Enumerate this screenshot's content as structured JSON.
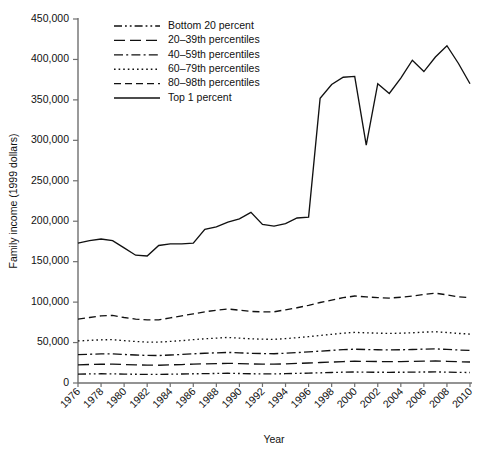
{
  "chart_data": {
    "type": "line",
    "title": "",
    "xlabel": "Year",
    "ylabel": "Family income (1999 dollars)",
    "xlim": [
      1976,
      2010
    ],
    "ylim": [
      0,
      450000
    ],
    "ytick_labels": [
      "0",
      "50,000",
      "100,000",
      "150,000",
      "200,000",
      "250,000",
      "300,000",
      "350,000",
      "400,000",
      "450,000"
    ],
    "ytick_values": [
      0,
      50000,
      100000,
      150000,
      200000,
      250000,
      300000,
      350000,
      400000,
      450000
    ],
    "xtick_labels": [
      "1976",
      "1978",
      "1980",
      "1982",
      "1984",
      "1986",
      "1988",
      "1990",
      "1992",
      "1994",
      "1996",
      "1998",
      "2000",
      "2002",
      "2004",
      "2006",
      "2008",
      "2010"
    ],
    "xtick_values": [
      1976,
      1978,
      1980,
      1982,
      1984,
      1986,
      1988,
      1990,
      1992,
      1994,
      1996,
      1998,
      2000,
      2002,
      2004,
      2006,
      2008,
      2010
    ],
    "grid": false,
    "legend_position": "top-left",
    "x": [
      1976,
      1977,
      1978,
      1979,
      1980,
      1981,
      1982,
      1983,
      1984,
      1985,
      1986,
      1987,
      1988,
      1989,
      1990,
      1991,
      1992,
      1993,
      1994,
      1995,
      1996,
      1997,
      1998,
      1999,
      2000,
      2001,
      2002,
      2003,
      2004,
      2005,
      2006,
      2007,
      2008,
      2009,
      2010
    ],
    "series": [
      {
        "name": "Bottom 20 percent",
        "dash": "dash-dot-dot",
        "values": [
          11000,
          11200,
          11400,
          11300,
          11000,
          10800,
          10600,
          10600,
          10900,
          11100,
          11400,
          11600,
          11800,
          12000,
          11700,
          11400,
          11300,
          11200,
          11500,
          11900,
          12200,
          12600,
          13000,
          13400,
          13600,
          13400,
          13300,
          13200,
          13300,
          13400,
          13600,
          13700,
          13400,
          13100,
          13000
        ]
      },
      {
        "name": "20–39th percentiles",
        "dash": "long-dash",
        "values": [
          22500,
          22900,
          23200,
          23300,
          22800,
          22400,
          22100,
          22000,
          22400,
          22800,
          23300,
          23700,
          24000,
          24300,
          24000,
          23600,
          23400,
          23300,
          23700,
          24200,
          24700,
          25300,
          25900,
          26500,
          26900,
          26700,
          26500,
          26400,
          26500,
          26700,
          27000,
          27200,
          26800,
          26300,
          26000
        ]
      },
      {
        "name": "40–59th percentiles",
        "dash": "dash-dot",
        "values": [
          35000,
          35500,
          36000,
          36100,
          35300,
          34600,
          34100,
          34000,
          34600,
          35300,
          36100,
          36800,
          37300,
          37800,
          37300,
          36700,
          36400,
          36200,
          36800,
          37600,
          38400,
          39400,
          40300,
          41200,
          41800,
          41400,
          41100,
          40900,
          41100,
          41400,
          41900,
          42200,
          41500,
          40800,
          40300
        ]
      },
      {
        "name": "60–79th percentiles",
        "dash": "dotted",
        "values": [
          52000,
          52700,
          53400,
          53600,
          52400,
          51300,
          50600,
          50500,
          51400,
          52400,
          53600,
          54700,
          55500,
          56300,
          55500,
          54600,
          54200,
          53900,
          54900,
          56000,
          57300,
          58800,
          60200,
          61600,
          62600,
          62000,
          61600,
          61300,
          61600,
          62100,
          62900,
          63400,
          62400,
          61300,
          60500
        ]
      },
      {
        "name": "80–98th percentiles",
        "dash": "dashed",
        "values": [
          79000,
          81000,
          83000,
          83500,
          81000,
          79000,
          78000,
          78000,
          80500,
          83000,
          85500,
          88000,
          90000,
          91500,
          90000,
          88500,
          88000,
          88000,
          90500,
          93000,
          96000,
          99500,
          102500,
          105500,
          107500,
          106500,
          105500,
          105000,
          106000,
          107500,
          109500,
          111000,
          109000,
          106500,
          105500
        ]
      },
      {
        "name": "Top 1 percent",
        "dash": "solid",
        "values": [
          173000,
          176000,
          178000,
          176000,
          167000,
          158000,
          157000,
          170000,
          172000,
          172000,
          173000,
          190000,
          193000,
          199000,
          203000,
          211000,
          196000,
          194000,
          197000,
          204000,
          205000,
          352000,
          369000,
          378000,
          379000,
          294000,
          370000,
          358000,
          377000,
          399000,
          385000,
          403000,
          417000,
          395000,
          370000
        ]
      }
    ]
  },
  "legend": {
    "items": [
      {
        "label": "Bottom 20 percent",
        "dash": "dash-dot-dot"
      },
      {
        "label": "20–39th percentiles",
        "dash": "long-dash"
      },
      {
        "label": "40–59th percentiles",
        "dash": "dash-dot"
      },
      {
        "label": "60–79th percentiles",
        "dash": "dotted"
      },
      {
        "label": "80–98th percentiles",
        "dash": "dashed"
      },
      {
        "label": "Top 1 percent",
        "dash": "solid"
      }
    ]
  }
}
